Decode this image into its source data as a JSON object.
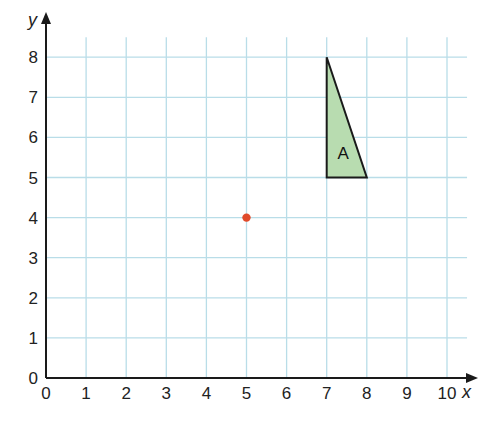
{
  "chart_data": {
    "type": "scatter",
    "title": "",
    "xlabel": "x",
    "ylabel": "y",
    "xlim": [
      0,
      10.5
    ],
    "ylim": [
      0,
      8.5
    ],
    "grid": true,
    "x_ticks": [
      0,
      1,
      2,
      3,
      4,
      5,
      6,
      7,
      8,
      9,
      10
    ],
    "y_ticks": [
      0,
      1,
      2,
      3,
      4,
      5,
      6,
      7,
      8
    ],
    "points": [
      {
        "x": 5,
        "y": 4,
        "color": "#e04a2a",
        "label": ""
      }
    ],
    "shapes": [
      {
        "name": "A",
        "type": "triangle",
        "vertices": [
          [
            7,
            8
          ],
          [
            7,
            5
          ],
          [
            8,
            5
          ]
        ],
        "fill": "#b8dcb0",
        "stroke": "#1a1a1a"
      }
    ]
  },
  "colors": {
    "grid": "#b9dde8",
    "axis": "#1a1a1a",
    "point": "#e04a2a",
    "shape_fill": "#b8dcb0"
  }
}
